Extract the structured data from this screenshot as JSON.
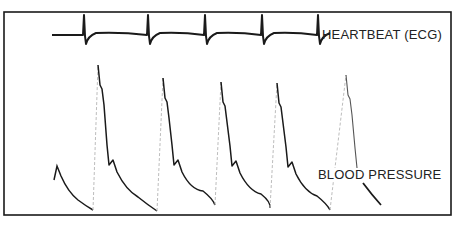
{
  "figure": {
    "type": "physiological-recording",
    "frame": {
      "x": 4,
      "y": 12,
      "width": 447,
      "height": 203,
      "border_color": "#1a1a1a"
    },
    "ink_color": "#1a1a1a",
    "faint_color": "#bdbdbd"
  },
  "labels": {
    "ecg": "HEARTBEAT (ECG)",
    "bp": "BLOOD PRESSURE"
  },
  "chart_data": {
    "type": "line",
    "title": "",
    "xlabel": "",
    "ylabel": "",
    "grid": false,
    "series": [
      {
        "name": "HEARTBEAT (ECG)",
        "baseline_y_px": 35,
        "beat_x_px": [
          84,
          148,
          205,
          262,
          318
        ],
        "spike_top_y_px": 15,
        "spike_dip_y_px": 44,
        "start_x_px": 52
      },
      {
        "name": "BLOOD PRESSURE",
        "beats": [
          {
            "upstroke_x": 96,
            "peak_x": 98,
            "peak_y": 65,
            "notch_y": 165,
            "trough_x": 157,
            "trough_y": 211
          },
          {
            "upstroke_x": 161,
            "peak_x": 163,
            "peak_y": 78,
            "notch_y": 165,
            "trough_x": 215,
            "trough_y": 205
          },
          {
            "upstroke_x": 219,
            "peak_x": 221,
            "peak_y": 82,
            "notch_y": 166,
            "trough_x": 270,
            "trough_y": 208
          },
          {
            "upstroke_x": 274,
            "peak_x": 277,
            "peak_y": 83,
            "notch_y": 167,
            "trough_x": 330,
            "trough_y": 210
          },
          {
            "upstroke_x": 344,
            "peak_x": 346,
            "peak_y": 75,
            "notch_y": 168,
            "trough_x": null,
            "trough_y": null
          }
        ],
        "partial_start": {
          "x": 54,
          "y": 180,
          "first_peak_y": 166,
          "trough_x": 93,
          "trough_y": 210
        },
        "tail_segment": {
          "x1": 363,
          "y1": 183,
          "x2": 381,
          "y2": 205
        }
      }
    ]
  }
}
